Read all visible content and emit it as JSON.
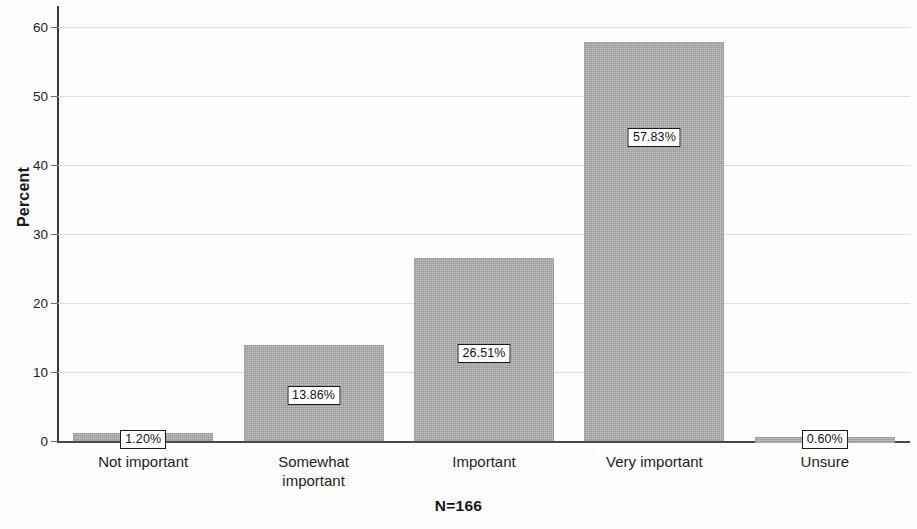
{
  "chart_data": {
    "type": "bar",
    "title": "",
    "subtitle": "",
    "xlabel": "",
    "ylabel": "Percent",
    "categories": [
      "Not important",
      "Somewhat important",
      "Important",
      "Very important",
      "Unsure"
    ],
    "values": [
      1.2,
      13.86,
      26.51,
      57.83,
      0.6
    ],
    "data_labels": [
      "1.20%",
      "13.86%",
      "26.51%",
      "57.83%",
      "0.60%"
    ],
    "ylim": [
      0,
      62
    ],
    "yticks": [
      0,
      10,
      20,
      30,
      40,
      50,
      60
    ],
    "ytick_labels": [
      "0",
      "10",
      "20",
      "30",
      "40",
      "50",
      "60"
    ],
    "grid": true,
    "grid_axis": "y",
    "legend": "none",
    "annotation": "N=166",
    "bar_color": "#a9a9a9",
    "gridline_color": "#dcdcdc",
    "axis_color": "#3a3a3a",
    "label_box_border_color": "#1a1a1a",
    "label_box_fill": "#ffffff"
  },
  "axis": {
    "y_title": "Percent",
    "ticks": [
      {
        "value": 60,
        "label": "60"
      },
      {
        "value": 50,
        "label": "50"
      },
      {
        "value": 40,
        "label": "40"
      },
      {
        "value": 30,
        "label": "30"
      },
      {
        "value": 20,
        "label": "20"
      },
      {
        "value": 10,
        "label": "10"
      },
      {
        "value": 0,
        "label": "0"
      }
    ]
  },
  "bars": [
    {
      "category": "Not important",
      "category_line1": "Not important",
      "category_line2": "",
      "value": 1.2,
      "label": "1.20%"
    },
    {
      "category": "Somewhat important",
      "category_line1": "Somewhat",
      "category_line2": "important",
      "value": 13.86,
      "label": "13.86%"
    },
    {
      "category": "Important",
      "category_line1": "Important",
      "category_line2": "",
      "value": 26.51,
      "label": "26.51%"
    },
    {
      "category": "Very important",
      "category_line1": "Very important",
      "category_line2": "",
      "value": 57.83,
      "label": "57.83%"
    },
    {
      "category": "Unsure",
      "category_line1": "Unsure",
      "category_line2": "",
      "value": 0.6,
      "label": "0.60%"
    }
  ],
  "footer": {
    "note": "N=166"
  }
}
